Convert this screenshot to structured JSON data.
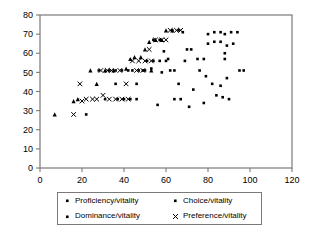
{
  "chart_data": {
    "type": "scatter",
    "title": "",
    "xlabel": "",
    "ylabel": "",
    "xlim": [
      0,
      120
    ],
    "ylim": [
      0,
      80
    ],
    "xticks": [
      0,
      20,
      40,
      60,
      80,
      100,
      120
    ],
    "yticks": [
      0,
      10,
      20,
      30,
      40,
      50,
      60,
      70,
      80
    ],
    "grid": false,
    "legend_position": "bottom",
    "series": [
      {
        "name": "Proficiency/vitality",
        "marker": "square-dot",
        "color": "#000000",
        "points": [
          [
            22,
            28
          ],
          [
            31,
            36
          ],
          [
            37,
            36
          ],
          [
            40,
            36
          ],
          [
            43,
            36
          ],
          [
            46,
            36
          ],
          [
            36,
            44
          ],
          [
            44,
            51
          ],
          [
            47,
            51
          ],
          [
            50,
            51
          ],
          [
            53,
            52
          ],
          [
            57,
            56
          ],
          [
            60,
            56
          ],
          [
            58,
            50
          ],
          [
            62,
            51
          ],
          [
            66,
            44
          ],
          [
            69,
            56
          ],
          [
            72,
            62
          ],
          [
            75,
            57
          ],
          [
            78,
            57
          ],
          [
            80,
            70
          ],
          [
            83,
            71
          ],
          [
            86,
            71
          ],
          [
            88,
            70
          ],
          [
            91,
            71
          ],
          [
            94,
            71
          ],
          [
            80,
            65
          ],
          [
            83,
            66
          ],
          [
            86,
            66
          ],
          [
            89,
            64
          ],
          [
            92,
            65
          ],
          [
            88,
            60
          ],
          [
            88,
            57
          ],
          [
            76,
            51
          ],
          [
            79,
            48
          ],
          [
            82,
            44
          ],
          [
            86,
            43
          ],
          [
            89,
            47
          ],
          [
            95,
            51
          ],
          [
            97,
            51
          ],
          [
            84,
            38
          ],
          [
            87,
            37
          ],
          [
            90,
            36
          ],
          [
            73,
            41
          ],
          [
            71,
            32
          ],
          [
            64,
            36
          ],
          [
            67,
            36
          ],
          [
            56,
            33
          ],
          [
            78,
            34
          ]
        ]
      },
      {
        "name": "Dominance/vitality",
        "marker": "triangle",
        "color": "#000000",
        "points": [
          [
            7,
            28
          ],
          [
            16,
            35
          ],
          [
            18,
            36
          ],
          [
            27,
            44
          ],
          [
            24,
            51
          ],
          [
            31,
            51
          ],
          [
            35,
            51
          ],
          [
            45,
            58
          ],
          [
            48,
            58
          ],
          [
            52,
            66
          ],
          [
            55,
            67
          ],
          [
            58,
            67
          ],
          [
            60,
            72
          ],
          [
            63,
            72
          ],
          [
            50,
            62
          ],
          [
            43,
            57
          ],
          [
            41,
            52
          ],
          [
            53,
            51
          ]
        ]
      },
      {
        "name": "Choice/vitality",
        "marker": "square-dot",
        "color": "#000000",
        "points": [
          [
            33,
            51
          ],
          [
            39,
            51
          ],
          [
            42,
            51
          ],
          [
            49,
            51
          ],
          [
            51,
            56
          ],
          [
            54,
            56
          ],
          [
            59,
            61
          ],
          [
            61,
            57
          ],
          [
            54,
            67
          ],
          [
            57,
            67
          ],
          [
            63,
            72
          ],
          [
            66,
            72
          ],
          [
            68,
            71
          ],
          [
            70,
            62
          ],
          [
            64,
            51
          ],
          [
            46,
            44
          ],
          [
            36,
            51
          ],
          [
            28,
            51
          ]
        ]
      },
      {
        "name": "Preference/vitality",
        "marker": "x",
        "color": "#000000",
        "points": [
          [
            16,
            28
          ],
          [
            20,
            35
          ],
          [
            22,
            36
          ],
          [
            25,
            36
          ],
          [
            27,
            36
          ],
          [
            19,
            44
          ],
          [
            29,
            51
          ],
          [
            32,
            51
          ],
          [
            34,
            51
          ],
          [
            38,
            51
          ],
          [
            41,
            44
          ],
          [
            44,
            56
          ],
          [
            47,
            56
          ],
          [
            50,
            56
          ],
          [
            53,
            56
          ],
          [
            46,
            51
          ],
          [
            49,
            51
          ],
          [
            52,
            62
          ],
          [
            55,
            67
          ],
          [
            58,
            67
          ],
          [
            60,
            67
          ],
          [
            62,
            72
          ],
          [
            65,
            72
          ],
          [
            67,
            72
          ],
          [
            30,
            38
          ],
          [
            33,
            36
          ],
          [
            36,
            36
          ],
          [
            39,
            36
          ],
          [
            42,
            36
          ]
        ]
      }
    ]
  },
  "legend": {
    "entries": [
      {
        "label": "Proficiency/vitality",
        "marker": "square-dot"
      },
      {
        "label": "Choice/vitality",
        "marker": "square-dot"
      },
      {
        "label": "Dominance/vitality",
        "marker": "square-dot"
      },
      {
        "label": "Preference/vitality",
        "marker": "x"
      }
    ]
  },
  "axes": {
    "y_labels": [
      "80",
      "70",
      "60",
      "50",
      "40",
      "30",
      "20",
      "10",
      "0"
    ],
    "x_labels": [
      "0",
      "20",
      "40",
      "60",
      "80",
      "100",
      "120"
    ]
  },
  "colors": {
    "axis": "#7a7a7a",
    "marker": "#000000",
    "text": "#000000",
    "background": "#ffffff"
  }
}
